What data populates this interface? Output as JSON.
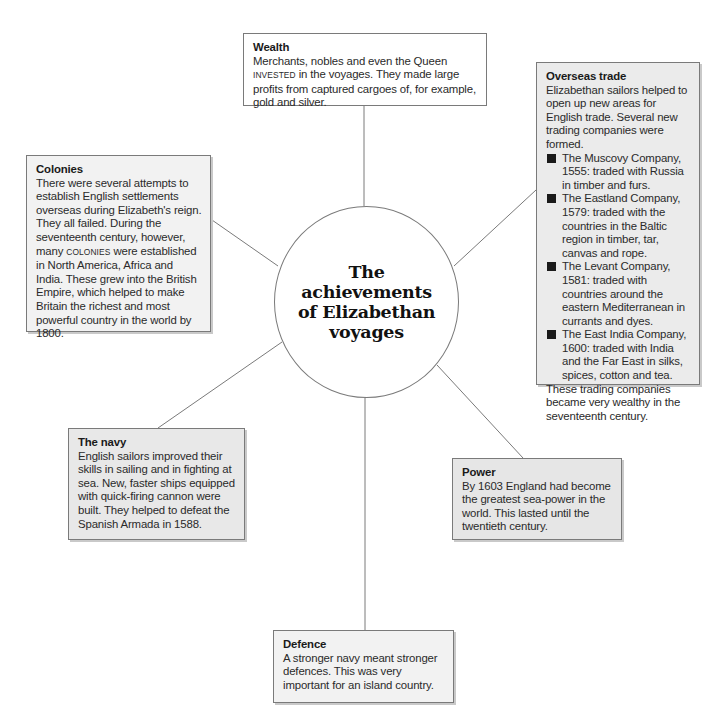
{
  "diagram": {
    "center": {
      "lines": [
        "The",
        "achievements",
        "of Elizabethan",
        "voyages"
      ]
    },
    "colors": {
      "border": "#7a7a7a",
      "white_fill": "#ffffff",
      "grey_fill": "#ebebeb",
      "light_fill": "#f2f2f2",
      "bullet": "#1a1a1a"
    },
    "boxes": {
      "wealth": {
        "title": "Wealth",
        "text_pre": "Merchants, nobles and even the Queen ",
        "text_keyword": "INVESTED",
        "text_post": " in the voyages. They made large profits from captured cargoes of, for example, gold and silver."
      },
      "overseas": {
        "title": "Overseas trade",
        "intro": "Elizabethan sailors helped to open up new areas for English trade. Several new trading companies were formed.",
        "items": [
          "The Muscovy Company, 1555: traded with Russia in timber and furs.",
          "The Eastland Company, 1579: traded with the countries in the Baltic region in timber, tar, canvas and rope.",
          "The Levant Company, 1581: traded with countries around the eastern Mediterranean in currants and dyes.",
          "The East India Company, 1600: traded with India and the Far East in silks, spices, cotton and tea."
        ],
        "outro": "These trading companies became very wealthy in the seventeenth century."
      },
      "colonies": {
        "title": "Colonies",
        "text_pre": "There were several attempts to establish English settlements overseas during Elizabeth's reign. They all failed. During the seventeenth century, however, many ",
        "text_keyword": "COLONIES",
        "text_post": " were established in North America, Africa and India. These grew into the British Empire, which helped to make Britain the richest and most powerful country in the world by 1800."
      },
      "navy": {
        "title": "The navy",
        "text": "English sailors improved their skills in sailing and in fighting at sea. New, faster ships equipped with quick-firing cannon were built. They helped to defeat the Spanish Armada in 1588."
      },
      "power": {
        "title": "Power",
        "text": "By 1603 England had become the greatest sea-power in the world. This lasted until the twentieth century."
      },
      "defence": {
        "title": "Defence",
        "text": "A stronger navy meant stronger defences. This was very important for an island country."
      }
    }
  }
}
